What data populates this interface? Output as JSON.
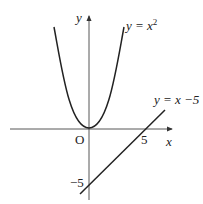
{
  "diagram": {
    "axes": {
      "x_label": "x",
      "y_label": "y",
      "origin_label": "O"
    },
    "ticks": {
      "x_tick": "5",
      "y_tick": "−5"
    },
    "curves": [
      {
        "name": "parabola",
        "label_lhs": "y = x",
        "label_exp": "2"
      },
      {
        "name": "line",
        "label": "y = x −5"
      }
    ],
    "colors": {
      "stroke": "#222222",
      "background": "#ffffff"
    }
  }
}
